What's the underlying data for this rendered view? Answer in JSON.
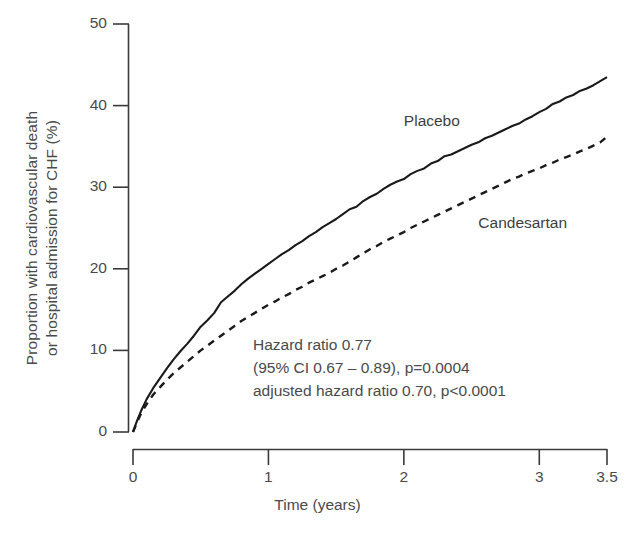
{
  "chart_data": {
    "type": "line",
    "title": "",
    "xlabel": "Time (years)",
    "ylabel_line1": "Proportion with cardiovascular death",
    "ylabel_line2": "or hospital admission for CHF (%)",
    "xlim": [
      0,
      3.5
    ],
    "ylim": [
      0,
      50
    ],
    "xticks": [
      0,
      1,
      2,
      3,
      3.5
    ],
    "xticklabels": [
      "0",
      "1",
      "2",
      "3",
      "3.5"
    ],
    "yticks": [
      0,
      10,
      20,
      30,
      40,
      50
    ],
    "yticklabels": [
      "0",
      "10",
      "20",
      "30",
      "40",
      "50"
    ],
    "grid": false,
    "legend_position": "inline-annotation",
    "series": [
      {
        "name": "Placebo",
        "style": "solid",
        "color": "#1a1a1a",
        "label_x": 2.0,
        "label_y": 38.0,
        "x": [
          0.0,
          0.03,
          0.06,
          0.1,
          0.15,
          0.2,
          0.25,
          0.3,
          0.35,
          0.4,
          0.45,
          0.5,
          0.55,
          0.6,
          0.65,
          0.7,
          0.75,
          0.8,
          0.85,
          0.9,
          0.95,
          1.0,
          1.05,
          1.1,
          1.15,
          1.2,
          1.25,
          1.3,
          1.35,
          1.4,
          1.45,
          1.5,
          1.55,
          1.6,
          1.65,
          1.7,
          1.75,
          1.8,
          1.85,
          1.9,
          1.95,
          2.0,
          2.05,
          2.1,
          2.15,
          2.2,
          2.25,
          2.3,
          2.35,
          2.4,
          2.45,
          2.5,
          2.55,
          2.6,
          2.65,
          2.7,
          2.75,
          2.8,
          2.85,
          2.9,
          2.95,
          3.0,
          3.05,
          3.1,
          3.15,
          3.2,
          3.25,
          3.3,
          3.35,
          3.4,
          3.45,
          3.5
        ],
        "y": [
          0.0,
          1.4,
          2.6,
          4.0,
          5.4,
          6.6,
          7.8,
          8.9,
          9.9,
          10.8,
          11.8,
          12.9,
          13.7,
          14.6,
          15.9,
          16.6,
          17.3,
          18.1,
          18.8,
          19.4,
          20.0,
          20.6,
          21.2,
          21.8,
          22.3,
          22.9,
          23.4,
          24.0,
          24.5,
          25.1,
          25.6,
          26.1,
          26.7,
          27.3,
          27.6,
          28.3,
          28.8,
          29.2,
          29.8,
          30.3,
          30.7,
          31.0,
          31.6,
          32.0,
          32.3,
          32.9,
          33.2,
          33.8,
          34.0,
          34.4,
          34.8,
          35.2,
          35.5,
          36.0,
          36.3,
          36.7,
          37.1,
          37.5,
          37.8,
          38.3,
          38.7,
          39.2,
          39.6,
          40.2,
          40.5,
          41.0,
          41.3,
          41.8,
          42.1,
          42.5,
          43.0,
          43.5
        ]
      },
      {
        "name": "Candesartan",
        "style": "dashed",
        "color": "#1a1a1a",
        "label_x": 2.55,
        "label_y": 25.5,
        "x": [
          0.0,
          0.03,
          0.06,
          0.1,
          0.15,
          0.2,
          0.25,
          0.3,
          0.35,
          0.4,
          0.45,
          0.5,
          0.55,
          0.6,
          0.65,
          0.7,
          0.75,
          0.8,
          0.85,
          0.9,
          0.95,
          1.0,
          1.05,
          1.1,
          1.15,
          1.2,
          1.25,
          1.3,
          1.35,
          1.4,
          1.45,
          1.5,
          1.55,
          1.6,
          1.65,
          1.7,
          1.75,
          1.8,
          1.85,
          1.9,
          1.95,
          2.0,
          2.05,
          2.1,
          2.15,
          2.2,
          2.25,
          2.3,
          2.35,
          2.4,
          2.45,
          2.5,
          2.55,
          2.6,
          2.65,
          2.7,
          2.75,
          2.8,
          2.85,
          2.9,
          2.95,
          3.0,
          3.05,
          3.1,
          3.15,
          3.2,
          3.25,
          3.3,
          3.35,
          3.4,
          3.45,
          3.5
        ],
        "y": [
          0.0,
          1.2,
          2.3,
          3.4,
          4.6,
          5.5,
          6.4,
          7.2,
          7.9,
          8.6,
          9.3,
          10.0,
          10.6,
          11.2,
          11.8,
          12.4,
          13.0,
          13.6,
          14.1,
          14.6,
          15.1,
          15.6,
          16.0,
          16.5,
          16.9,
          17.4,
          17.8,
          18.3,
          18.7,
          19.1,
          19.5,
          20.0,
          20.4,
          20.9,
          21.4,
          21.9,
          22.4,
          22.8,
          23.3,
          23.7,
          24.1,
          24.5,
          25.0,
          25.4,
          25.8,
          26.2,
          26.6,
          27.0,
          27.4,
          27.8,
          28.2,
          28.6,
          29.0,
          29.4,
          29.8,
          30.2,
          30.6,
          31.0,
          31.3,
          31.7,
          32.0,
          32.3,
          32.7,
          33.0,
          33.4,
          33.7,
          34.0,
          34.4,
          34.7,
          35.1,
          35.5,
          36.2
        ]
      }
    ],
    "annotations": [
      "Hazard ratio 0.77",
      "(95% CI 0.67 – 0.89), p=0.0004",
      "adjusted hazard ratio 0.70, p<0.0001"
    ]
  }
}
